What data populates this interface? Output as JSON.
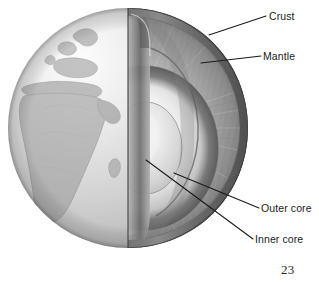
{
  "figure": {
    "name": "earth-interior-cutaway",
    "page_number": "23",
    "background_color": "#ffffff",
    "line_color": "#1a1a1a",
    "text_color": "#1b1b1b"
  },
  "labels": [
    {
      "id": "crust",
      "text": "Crust",
      "icon": "leader-line-icon",
      "leader": {
        "x1": 209,
        "y1": 35,
        "x2": 266,
        "y2": 16
      }
    },
    {
      "id": "mantle",
      "text": "Mantle",
      "icon": "leader-line-icon",
      "leader": {
        "x1": 201,
        "y1": 63,
        "x2": 261,
        "y2": 56
      }
    },
    {
      "id": "outer-core",
      "text": "Outer core",
      "icon": "leader-line-icon",
      "leader": {
        "x1": 174,
        "y1": 173,
        "x2": 259,
        "y2": 208
      }
    },
    {
      "id": "inner-core",
      "text": "Inner core",
      "icon": "leader-line-icon",
      "leader": {
        "x1": 146,
        "y1": 160,
        "x2": 253,
        "y2": 239
      }
    }
  ],
  "layers": {
    "crust": {
      "name": "Crust",
      "tone": "#8f8f8f"
    },
    "mantle": {
      "name": "Mantle",
      "tone": "#a9a9a9"
    },
    "outer_core": {
      "name": "Outer core",
      "tone": "#cfcfcf"
    },
    "inner_core": {
      "name": "Inner core",
      "tone": "#ededed"
    },
    "surface": {
      "name": "Globe surface with continents",
      "tone": "#d8d8d8"
    }
  },
  "globe": {
    "center_x": 128,
    "center_y": 128,
    "radius": 120,
    "continents_visible": "Europe and Africa"
  }
}
